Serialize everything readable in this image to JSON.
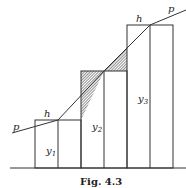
{
  "figure": {
    "caption": "Fig. 4.3",
    "labels": {
      "p_left": "p",
      "p_right": "p",
      "h1": "h",
      "h3": "h",
      "y1": "y",
      "y1_sub": "1",
      "y2": "y",
      "y2_sub": "2",
      "y3": "y",
      "y3_sub": "3"
    },
    "colors": {
      "stroke": "#333333",
      "hatch": "#555555",
      "background": "#ffffff"
    }
  }
}
